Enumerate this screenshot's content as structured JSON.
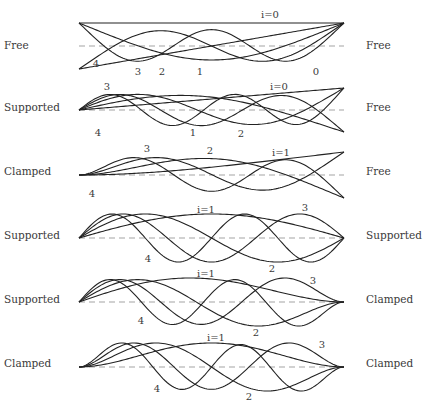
{
  "style": {
    "curve_color": "#222222",
    "axis_dash_color": "#999999"
  },
  "beam": {
    "x_left": 79,
    "x_right": 344
  },
  "panels": [
    {
      "left_bc": "Free",
      "right_bc": "Free",
      "center_y": 46,
      "amp": 23,
      "label_y": 46,
      "annotations": [
        {
          "text": "i=0",
          "x": 270,
          "y": 14
        },
        {
          "text": "4",
          "x": 96,
          "y": 63
        },
        {
          "text": "3",
          "x": 138,
          "y": 71
        },
        {
          "text": "2",
          "x": 162,
          "y": 71
        },
        {
          "text": "1",
          "x": 200,
          "y": 71
        },
        {
          "text": "0",
          "x": 316,
          "y": 71
        }
      ]
    },
    {
      "left_bc": "Supported",
      "right_bc": "Free",
      "center_y": 110,
      "amp": 22,
      "label_y": 108,
      "annotations": [
        {
          "text": "3",
          "x": 107,
          "y": 86
        },
        {
          "text": "i=0",
          "x": 279,
          "y": 86
        },
        {
          "text": "4",
          "x": 98,
          "y": 132
        },
        {
          "text": "1",
          "x": 193,
          "y": 132
        },
        {
          "text": "2",
          "x": 241,
          "y": 133
        }
      ]
    },
    {
      "left_bc": "Clamped",
      "right_bc": "Free",
      "center_y": 175,
      "amp": 23,
      "label_y": 172,
      "annotations": [
        {
          "text": "3",
          "x": 147,
          "y": 148
        },
        {
          "text": "2",
          "x": 210,
          "y": 150
        },
        {
          "text": "i=1",
          "x": 281,
          "y": 152
        },
        {
          "text": "4",
          "x": 92,
          "y": 193
        }
      ]
    },
    {
      "left_bc": "Supported",
      "right_bc": "Supported",
      "center_y": 238,
      "amp": 24,
      "label_y": 236,
      "annotations": [
        {
          "text": "i=1",
          "x": 206,
          "y": 209
        },
        {
          "text": "3",
          "x": 305,
          "y": 207
        },
        {
          "text": "4",
          "x": 148,
          "y": 258
        },
        {
          "text": "2",
          "x": 272,
          "y": 268
        }
      ]
    },
    {
      "left_bc": "Supported",
      "right_bc": "Clamped",
      "center_y": 302,
      "amp": 24,
      "label_y": 300,
      "annotations": [
        {
          "text": "i=1",
          "x": 206,
          "y": 273
        },
        {
          "text": "3",
          "x": 313,
          "y": 280
        },
        {
          "text": "4",
          "x": 141,
          "y": 320
        },
        {
          "text": "2",
          "x": 256,
          "y": 332
        }
      ]
    },
    {
      "left_bc": "Clamped",
      "right_bc": "Clamped",
      "center_y": 367,
      "amp": 24,
      "label_y": 364,
      "annotations": [
        {
          "text": "i=1",
          "x": 216,
          "y": 337
        },
        {
          "text": "3",
          "x": 322,
          "y": 344
        },
        {
          "text": "4",
          "x": 157,
          "y": 388
        },
        {
          "text": "2",
          "x": 249,
          "y": 396
        }
      ]
    }
  ]
}
